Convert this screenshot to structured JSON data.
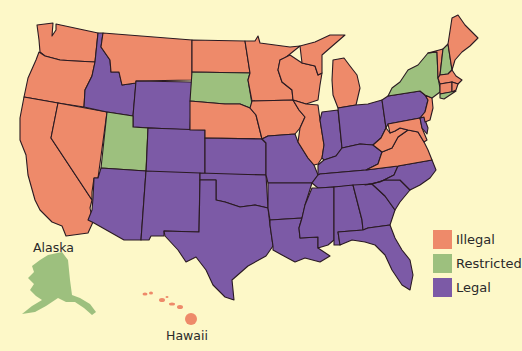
{
  "map": {
    "type": "choropleth",
    "region": "United States",
    "background": "#FDF8C8",
    "border_color": "#2a1a22"
  },
  "legend": {
    "items": [
      {
        "key": "illegal",
        "label": "Illegal",
        "color": "#EE8A6A"
      },
      {
        "key": "restricted",
        "label": "Restricted",
        "color": "#9DC07E"
      },
      {
        "key": "legal",
        "label": "Legal",
        "color": "#7C5AA6"
      }
    ]
  },
  "labels": {
    "alaska": "Alaska",
    "hawaii": "Hawaii"
  },
  "chart_data": {
    "type": "choropleth",
    "title": "",
    "legend": [
      "Illegal",
      "Restricted",
      "Legal"
    ],
    "legend_position": "bottom-right",
    "categories": {
      "Illegal": [
        "WA",
        "OR",
        "CA",
        "NV",
        "MT",
        "ND",
        "MN",
        "WI",
        "MI",
        "IA",
        "NE",
        "IL",
        "WV",
        "VA",
        "MD",
        "NJ",
        "ME",
        "VT",
        "MA",
        "CT",
        "RI",
        "HI"
      ],
      "Restricted": [
        "UT",
        "SD",
        "NY",
        "NH",
        "AK"
      ],
      "Legal": [
        "ID",
        "WY",
        "CO",
        "AZ",
        "NM",
        "TX",
        "OK",
        "KS",
        "MO",
        "AR",
        "LA",
        "MS",
        "AL",
        "GA",
        "FL",
        "SC",
        "NC",
        "TN",
        "KY",
        "IN",
        "OH",
        "PA",
        "DE"
      ]
    }
  },
  "states": [
    {
      "id": "WA",
      "status": "illegal",
      "d": "M37,25 L53,23 L52,36 L56,30 L56,24 L98,33 L95,62 L75,61 L60,60 L45,56 L40,52 L39,40 Z"
    },
    {
      "id": "OR",
      "status": "illegal",
      "d": "M39,52 L45,56 L60,60 L75,61 L95,62 L92,76 L85,90 L84,107 L58,103 L24,97 L28,78 L36,60 Z"
    },
    {
      "id": "CA",
      "status": "illegal",
      "d": "M24,97 L58,103 L51,138 L92,200 L90,208 L93,222 L88,233 L66,236 L62,226 L52,222 L40,210 L35,200 L28,175 L26,155 L20,140 L20,118 Z"
    },
    {
      "id": "NV",
      "status": "illegal",
      "d": "M58,103 L107,112 L98,178 L94,178 L92,192 L92,200 L51,138 Z"
    },
    {
      "id": "ID",
      "status": "legal",
      "d": "M98,33 L103,33 L101,47 L110,60 L111,72 L119,72 L122,85 L136,83 L133,116 L107,112 L84,107 L85,90 L92,76 L95,62 Z"
    },
    {
      "id": "MT",
      "status": "illegal",
      "d": "M103,33 L192,40 L192,80 L136,81 L136,83 L122,85 L119,72 L111,72 L110,60 L101,47 Z"
    },
    {
      "id": "WY",
      "status": "legal",
      "d": "M136,81 L192,82 L190,130 L133,127 L133,116 Z"
    },
    {
      "id": "UT",
      "status": "restricted",
      "d": "M107,112 L133,116 L133,127 L148,128 L146,171 L101,168 Z"
    },
    {
      "id": "CO",
      "status": "legal",
      "d": "M148,128 L205,130 L205,175 L146,174 Z"
    },
    {
      "id": "AZ",
      "status": "legal",
      "d": "M101,168 L146,171 L141,240 L124,240 L94,223 L88,220 L92,210 L93,198 L94,178 L98,178 Z"
    },
    {
      "id": "NM",
      "status": "legal",
      "d": "M146,171 L200,173 L199,232 L164,231 L164,236 L151,236 L149,240 L141,240 Z"
    },
    {
      "id": "ND",
      "status": "illegal",
      "d": "M192,40 L245,41 L250,73 L192,72 Z"
    },
    {
      "id": "SD",
      "status": "restricted",
      "d": "M192,72 L250,73 L248,80 L252,104 L250,108 L240,104 L225,104 L190,101 Z"
    },
    {
      "id": "NE",
      "status": "illegal",
      "d": "M190,101 L225,104 L240,104 L250,108 L256,115 L262,139 L205,138 L205,130 L190,130 Z"
    },
    {
      "id": "KS",
      "status": "legal",
      "d": "M205,138 L262,139 L266,143 L266,175 L205,175 Z"
    },
    {
      "id": "OK",
      "status": "legal",
      "d": "M200,173 L266,175 L268,208 L255,205 L240,207 L225,202 L216,200 L216,180 L200,180 Z"
    },
    {
      "id": "TX",
      "status": "legal",
      "d": "M200,180 L216,180 L216,200 L225,202 L240,207 L255,205 L268,208 L270,225 L273,246 L266,256 L248,266 L232,280 L234,300 L225,297 L213,285 L206,270 L196,257 L186,262 L178,250 L165,236 L164,231 L199,232 Z"
    },
    {
      "id": "MN",
      "status": "illegal",
      "d": "M245,41 L255,41 L258,36 L260,43 L275,45 L290,47 L300,46 L285,58 L280,60 L278,70 L282,82 L292,90 L293,100 L252,101 L248,80 L250,73 Z"
    },
    {
      "id": "IA",
      "status": "illegal",
      "d": "M252,101 L293,100 L299,110 L305,117 L300,128 L295,134 L268,136 L262,139 L256,115 L250,108 Z"
    },
    {
      "id": "MO",
      "status": "legal",
      "d": "M262,139 L268,136 L295,134 L298,142 L308,158 L314,165 L318,175 L312,183 L268,183 L266,175 L266,143 Z"
    },
    {
      "id": "AR",
      "status": "legal",
      "d": "M268,183 L312,183 L305,205 L302,218 L270,220 L268,208 Z"
    },
    {
      "id": "LA",
      "status": "legal",
      "d": "M270,220 L302,218 L299,228 L300,238 L318,237 L318,248 L330,256 L320,262 L305,258 L295,262 L282,255 L273,250 L273,246 L270,225 Z"
    },
    {
      "id": "WI",
      "status": "illegal",
      "d": "M280,60 L290,55 L302,63 L315,66 L318,75 L322,73 L320,85 L318,100 L306,104 L293,100 L292,90 L282,82 L278,70 Z"
    },
    {
      "id": "IL",
      "status": "illegal",
      "d": "M293,100 L306,104 L318,105 L320,120 L324,145 L322,158 L318,164 L314,165 L308,158 L298,142 L300,128 L305,117 L299,110 Z"
    },
    {
      "id": "MI",
      "status": "illegal",
      "d": "M300,46 L315,42 L330,35 L345,35 L330,48 L322,55 L322,73 L318,75 L315,66 L302,63 Z M333,60 L344,58 L350,66 L357,75 L360,88 L356,105 L338,108 L333,95 L332,80 Z"
    },
    {
      "id": "IN",
      "status": "legal",
      "d": "M322,112 L338,110 L342,148 L336,156 L324,160 L322,158 L324,145 L320,120 Z"
    },
    {
      "id": "OH",
      "status": "legal",
      "d": "M338,108 L356,105 L368,104 L382,100 L386,128 L381,138 L373,145 L360,144 L342,148 Z"
    },
    {
      "id": "KY",
      "status": "legal",
      "d": "M324,160 L336,156 L342,148 L360,144 L373,145 L382,152 L378,164 L366,170 L320,174 L318,175 L318,165 Z"
    },
    {
      "id": "TN",
      "status": "legal",
      "d": "M312,183 L318,175 L320,174 L366,170 L398,166 L394,175 L380,182 L365,185 L318,188 Z"
    },
    {
      "id": "MS",
      "status": "legal",
      "d": "M318,188 L334,187 L334,240 L328,245 L318,248 L318,237 L300,238 L299,228 L302,218 L305,205 L312,188 Z"
    },
    {
      "id": "AL",
      "status": "legal",
      "d": "M334,187 L353,185 L362,220 L363,230 L338,232 L340,245 L334,245 L334,240 Z"
    },
    {
      "id": "GA",
      "status": "legal",
      "d": "M353,185 L372,184 L385,196 L395,210 L390,225 L368,228 L363,230 L362,220 Z"
    },
    {
      "id": "FL",
      "status": "legal",
      "d": "M338,232 L363,230 L368,228 L390,225 L395,238 L402,250 L410,260 L413,275 L410,290 L402,285 L392,270 L385,255 L375,245 L365,242 L352,240 L340,245 Z"
    },
    {
      "id": "SC",
      "status": "legal",
      "d": "M372,184 L385,180 L400,180 L410,190 L400,202 L395,210 L385,196 Z"
    },
    {
      "id": "NC",
      "status": "legal",
      "d": "M365,185 L380,182 L394,175 L398,166 L432,160 L436,170 L430,178 L420,185 L410,190 L400,180 L385,180 L372,184 Z"
    },
    {
      "id": "VA",
      "status": "illegal",
      "d": "M366,170 L378,164 L382,152 L392,148 L398,137 L408,130 L418,132 L424,142 L428,150 L432,160 L398,166 Z"
    },
    {
      "id": "WV",
      "status": "illegal",
      "d": "M373,145 L381,138 L386,128 L390,133 L395,131 L400,128 L408,130 L398,137 L392,148 L382,152 Z"
    },
    {
      "id": "PA",
      "status": "legal",
      "d": "M382,100 L388,96 L420,91 L425,95 L428,100 L425,112 L420,118 L388,124 L386,128 Z"
    },
    {
      "id": "MD",
      "status": "illegal",
      "d": "M388,124 L420,118 L422,128 L427,140 L424,142 L418,132 L408,130 L400,128 L395,131 L390,133 Z"
    },
    {
      "id": "DE",
      "status": "legal",
      "d": "M420,118 L424,117 L428,128 L427,134 L422,128 Z"
    },
    {
      "id": "NJ",
      "status": "illegal",
      "d": "M425,95 L432,98 L433,108 L430,120 L425,122 L424,117 L420,118 L425,112 L428,100 Z"
    },
    {
      "id": "NY",
      "status": "restricted",
      "d": "M388,96 L392,88 L400,82 L408,70 L418,65 L428,53 L437,52 L438,78 L440,88 L440,92 L432,98 L425,95 L420,91 Z"
    },
    {
      "id": "VT",
      "status": "illegal",
      "d": "M428,53 L443,49 L440,75 L438,78 L437,52 Z"
    },
    {
      "id": "NH",
      "status": "restricted",
      "d": "M443,49 L448,44 L452,70 L448,74 L440,75 Z"
    },
    {
      "id": "ME",
      "status": "illegal",
      "d": "M448,44 L452,18 L458,15 L465,25 L470,30 L478,38 L470,46 L462,52 L455,60 L452,70 Z"
    },
    {
      "id": "MA",
      "status": "illegal",
      "d": "M438,78 L440,75 L448,74 L452,70 L456,76 L462,80 L458,84 L452,82 L440,84 Z"
    },
    {
      "id": "CT",
      "status": "illegal",
      "d": "M440,84 L452,82 L452,92 L440,94 L440,88 Z"
    },
    {
      "id": "RI",
      "status": "illegal",
      "d": "M452,82 L458,84 L456,90 L452,92 Z"
    },
    {
      "id": "LI",
      "status": "restricted",
      "d": "M440,94 L456,91 L444,99 L440,98 Z"
    }
  ],
  "insets": {
    "alaska": {
      "id": "AK",
      "status": "restricted",
      "d": "M48,255 L62,252 L68,260 L70,280 L72,295 L80,298 L90,304 L96,312 L92,315 L84,308 L75,302 L66,302 L58,298 L46,306 L35,312 L22,314 L32,306 L42,300 L36,296 L30,290 L34,284 L28,278 L34,272 L32,266 L40,260 Z"
    },
    "hawaii": [
      {
        "cx": 145,
        "cy": 294,
        "rx": 2.5,
        "ry": 1.5
      },
      {
        "cx": 151,
        "cy": 293,
        "rx": 2,
        "ry": 1.5
      },
      {
        "cx": 162,
        "cy": 300,
        "rx": 3,
        "ry": 2
      },
      {
        "cx": 167,
        "cy": 297,
        "rx": 1.5,
        "ry": 1
      },
      {
        "cx": 172,
        "cy": 304,
        "rx": 3,
        "ry": 1.5
      },
      {
        "cx": 180,
        "cy": 307,
        "rx": 3,
        "ry": 2
      },
      {
        "cx": 191,
        "cy": 319,
        "rx": 6,
        "ry": 6
      }
    ]
  }
}
